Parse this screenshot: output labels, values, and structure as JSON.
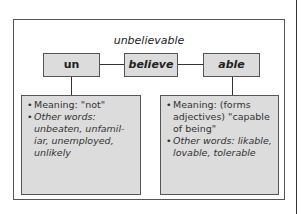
{
  "diagram": {
    "word": "unbelievable",
    "parts": [
      {
        "label": "un"
      },
      {
        "label": "believe"
      },
      {
        "label": "able"
      }
    ],
    "details": {
      "un": {
        "meaning": "Meaning: \"not\"",
        "other_words": "Other words: unbeaten, unfamil-iar, unemployed, unlikely"
      },
      "able": {
        "meaning": "Meaning: (forms adjectives) \"capable of being\"",
        "other_words": "Other words: likable, lovable, tolerable"
      }
    },
    "colors": {
      "box_fill": "#dcdcdc",
      "border": "#555555",
      "background": "#ffffff"
    }
  }
}
